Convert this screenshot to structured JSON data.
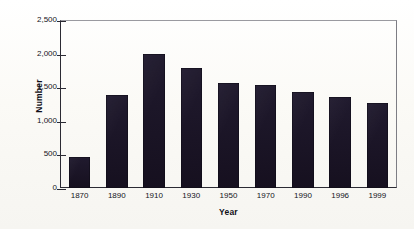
{
  "chart_data": {
    "type": "bar",
    "title": "",
    "subtitle": "",
    "xlabel": "Year",
    "ylabel": "Number",
    "categories": [
      "1870",
      "1890",
      "1910",
      "1930",
      "1950",
      "1970",
      "1990",
      "1996",
      "1999"
    ],
    "values": [
      460,
      1390,
      2000,
      1790,
      1560,
      1540,
      1430,
      1350,
      1265
    ],
    "series": [
      {
        "name": "Number",
        "values": [
          460,
          1390,
          2000,
          1790,
          1560,
          1540,
          1430,
          1350,
          1265
        ]
      }
    ],
    "ylim": [
      0,
      2500
    ],
    "ytick_values": [
      0,
      500,
      1000,
      1500,
      2000,
      2500
    ],
    "ytick_labels": [
      "0",
      "500",
      "1,000",
      "1,500",
      "2,000",
      "2,500"
    ],
    "grid": false,
    "legend": "none",
    "bar_color": "#1b1427",
    "axis_color": "#2b2a33",
    "background_color": "#fbfaf7",
    "annotations": []
  }
}
